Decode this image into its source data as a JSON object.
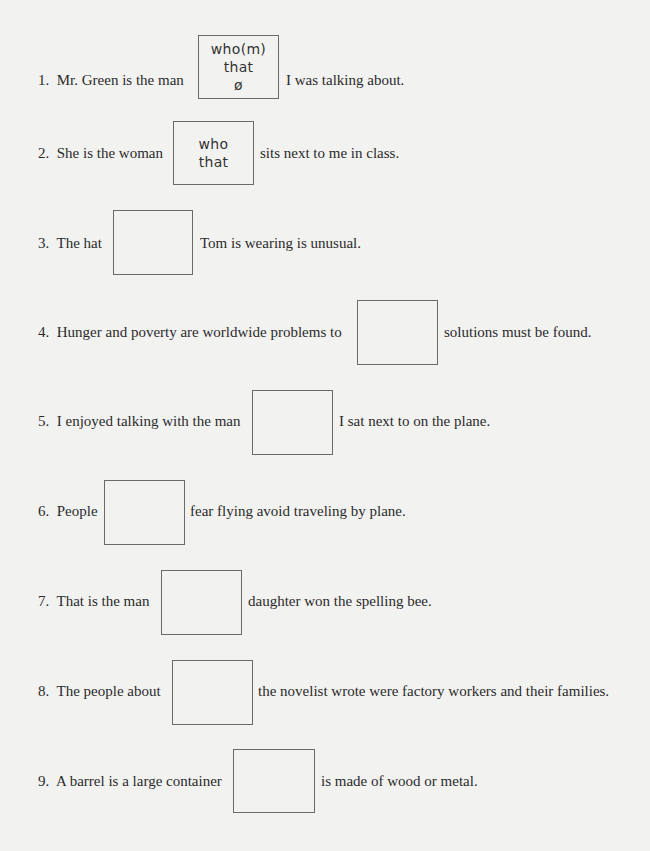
{
  "items": [
    {
      "num": "1.",
      "before": "Mr. Green is the man",
      "after": "I was talking about.",
      "answers": [
        "who(m)",
        "that",
        "ø"
      ]
    },
    {
      "num": "2.",
      "before": "She is the woman",
      "after": "sits next to me in class.",
      "answers": [
        "who",
        "that"
      ]
    },
    {
      "num": "3.",
      "before": "The hat",
      "after": "Tom is wearing is unusual.",
      "answers": []
    },
    {
      "num": "4.",
      "before": "Hunger and poverty are worldwide problems to",
      "after": "solutions must be found.",
      "answers": []
    },
    {
      "num": "5.",
      "before": "I enjoyed talking with the man",
      "after": "I sat next to on the plane.",
      "answers": []
    },
    {
      "num": "6.",
      "before": "People",
      "after": "fear flying avoid traveling by plane.",
      "answers": []
    },
    {
      "num": "7.",
      "before": "That is the man",
      "after": "daughter won the spelling bee.",
      "answers": []
    },
    {
      "num": "8.",
      "before": "The people about",
      "after": "the novelist wrote were factory workers and their families.",
      "answers": []
    },
    {
      "num": "9.",
      "before": "A barrel is a large container",
      "after": "is made of wood or metal.",
      "answers": []
    }
  ]
}
